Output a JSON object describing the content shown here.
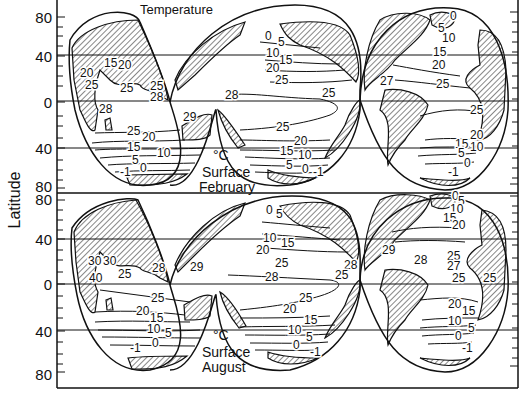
{
  "figure": {
    "title": "Temperature",
    "y_axis_label": "Latitude",
    "panels": [
      {
        "id": "february",
        "unit": "°C",
        "line1": "Surface",
        "line2": "February",
        "lat_ticks": [
          "80",
          "40",
          "0",
          "40",
          "80"
        ]
      },
      {
        "id": "august",
        "unit": "°C",
        "line1": "Surface",
        "line2": "August",
        "lat_ticks": [
          "80",
          "40",
          "0",
          "40",
          "80"
        ]
      }
    ]
  },
  "chart_data": [
    {
      "type": "contour-map",
      "title": "Temperature",
      "subtitle": "°C Surface February",
      "ylabel": "Latitude",
      "yticks": [
        "80N",
        "40N",
        "0",
        "40S",
        "80S"
      ],
      "isotherm_labels": {
        "indian_ocean": [
          "15",
          "20",
          "20",
          "25",
          "25",
          "25",
          "28",
          "28",
          "29",
          "25",
          "20",
          "15",
          "10",
          "5",
          "0",
          "-1"
        ],
        "pacific_ocean": [
          "0",
          "5",
          "10",
          "15",
          "20",
          "25",
          "28",
          "25",
          "25",
          "20",
          "15",
          "10",
          "5",
          "0",
          "-1"
        ],
        "atlantic_ocean": [
          "0",
          "5",
          "10",
          "15",
          "20",
          "27",
          "25",
          "25",
          "20",
          "15",
          "10",
          "5",
          "0",
          "-1"
        ]
      }
    },
    {
      "type": "contour-map",
      "title": "",
      "subtitle": "°C Surface August",
      "ylabel": "Latitude",
      "yticks": [
        "80N",
        "40N",
        "0",
        "40S",
        "80S"
      ],
      "isotherm_labels": {
        "indian_ocean": [
          "30",
          "30",
          "40",
          "25",
          "28",
          "25",
          "20",
          "15",
          "10",
          "5",
          "0",
          "-1"
        ],
        "pacific_ocean": [
          "0",
          "5",
          "10",
          "15",
          "20",
          "25",
          "29",
          "28",
          "28",
          "25",
          "25",
          "20",
          "15",
          "10",
          "5",
          "0",
          "-1"
        ],
        "atlantic_ocean": [
          "0",
          "5",
          "10",
          "15",
          "20",
          "29",
          "28",
          "25",
          "27",
          "25",
          "25",
          "20",
          "15",
          "10",
          "5",
          "0",
          "-1"
        ]
      }
    }
  ],
  "labels": {
    "feb": {
      "io": [
        {
          "t": "15",
          "x": 104,
          "y": 67
        },
        {
          "t": "20",
          "x": 118,
          "y": 69
        },
        {
          "t": "20",
          "x": 80,
          "y": 77
        },
        {
          "t": "25",
          "x": 85,
          "y": 89
        },
        {
          "t": "25",
          "x": 120,
          "y": 92
        },
        {
          "t": "25",
          "x": 150,
          "y": 90
        },
        {
          "t": "28",
          "x": 150,
          "y": 101
        },
        {
          "t": "28",
          "x": 99,
          "y": 113
        },
        {
          "t": "29",
          "x": 183,
          "y": 121
        },
        {
          "t": "25",
          "x": 127,
          "y": 135
        },
        {
          "t": "20",
          "x": 142,
          "y": 141
        },
        {
          "t": "15",
          "x": 127,
          "y": 151
        },
        {
          "t": "10",
          "x": 157,
          "y": 157
        },
        {
          "t": "5",
          "x": 132,
          "y": 164
        },
        {
          "t": "0",
          "x": 140,
          "y": 172
        },
        {
          "t": "-1",
          "x": 120,
          "y": 176
        }
      ],
      "po": [
        {
          "t": "28",
          "x": 225,
          "y": 99
        },
        {
          "t": "0",
          "x": 265,
          "y": 40
        },
        {
          "t": "5",
          "x": 278,
          "y": 46
        },
        {
          "t": "10",
          "x": 266,
          "y": 57
        },
        {
          "t": "15",
          "x": 279,
          "y": 64
        },
        {
          "t": "20",
          "x": 266,
          "y": 72
        },
        {
          "t": "25",
          "x": 275,
          "y": 84
        },
        {
          "t": "25",
          "x": 322,
          "y": 97
        },
        {
          "t": "25",
          "x": 275,
          "y": 131
        },
        {
          "t": "20",
          "x": 294,
          "y": 145
        },
        {
          "t": "25",
          "x": 276,
          "y": 131
        },
        {
          "t": "15",
          "x": 280,
          "y": 155
        },
        {
          "t": "10",
          "x": 298,
          "y": 159
        },
        {
          "t": "5",
          "x": 286,
          "y": 169
        },
        {
          "t": "0",
          "x": 302,
          "y": 173
        },
        {
          "t": "-1",
          "x": 313,
          "y": 176
        }
      ],
      "ao": [
        {
          "t": "0",
          "x": 450,
          "y": 20
        },
        {
          "t": "5",
          "x": 438,
          "y": 32
        },
        {
          "t": "10",
          "x": 442,
          "y": 42
        },
        {
          "t": "15",
          "x": 433,
          "y": 56
        },
        {
          "t": "20",
          "x": 432,
          "y": 69
        },
        {
          "t": "27",
          "x": 380,
          "y": 85
        },
        {
          "t": "25",
          "x": 436,
          "y": 88
        },
        {
          "t": "25",
          "x": 470,
          "y": 114
        },
        {
          "t": "20",
          "x": 470,
          "y": 139
        },
        {
          "t": "15",
          "x": 455,
          "y": 148
        },
        {
          "t": "10",
          "x": 470,
          "y": 151
        },
        {
          "t": "5",
          "x": 458,
          "y": 157
        },
        {
          "t": "0",
          "x": 464,
          "y": 167
        },
        {
          "t": "-1",
          "x": 448,
          "y": 176
        }
      ]
    },
    "aug": {
      "io": [
        {
          "t": "30",
          "x": 88,
          "y": 265
        },
        {
          "t": "30",
          "x": 103,
          "y": 265
        },
        {
          "t": "40",
          "x": 89,
          "y": 282
        },
        {
          "t": "25",
          "x": 118,
          "y": 278
        },
        {
          "t": "28",
          "x": 152,
          "y": 272
        },
        {
          "t": "25",
          "x": 151,
          "y": 302
        },
        {
          "t": "20",
          "x": 136,
          "y": 315
        },
        {
          "t": "15",
          "x": 150,
          "y": 322
        },
        {
          "t": "10",
          "x": 147,
          "y": 333
        },
        {
          "t": "5",
          "x": 165,
          "y": 337
        },
        {
          "t": "0",
          "x": 152,
          "y": 347
        },
        {
          "t": "-1",
          "x": 130,
          "y": 352
        }
      ],
      "po": [
        {
          "t": "0",
          "x": 266,
          "y": 214
        },
        {
          "t": "5",
          "x": 276,
          "y": 218
        },
        {
          "t": "10",
          "x": 263,
          "y": 242
        },
        {
          "t": "15",
          "x": 281,
          "y": 247
        },
        {
          "t": "20",
          "x": 256,
          "y": 254
        },
        {
          "t": "25",
          "x": 275,
          "y": 267
        },
        {
          "t": "29",
          "x": 190,
          "y": 271
        },
        {
          "t": "28",
          "x": 265,
          "y": 281
        },
        {
          "t": "28",
          "x": 344,
          "y": 269
        },
        {
          "t": "25",
          "x": 335,
          "y": 279
        },
        {
          "t": "25",
          "x": 299,
          "y": 302
        },
        {
          "t": "20",
          "x": 283,
          "y": 313
        },
        {
          "t": "15",
          "x": 304,
          "y": 324
        },
        {
          "t": "10",
          "x": 288,
          "y": 334
        },
        {
          "t": "5",
          "x": 306,
          "y": 341
        },
        {
          "t": "0",
          "x": 293,
          "y": 349
        },
        {
          "t": "-1",
          "x": 310,
          "y": 356
        }
      ],
      "ao": [
        {
          "t": "0",
          "x": 452,
          "y": 200
        },
        {
          "t": "5",
          "x": 458,
          "y": 205
        },
        {
          "t": "10",
          "x": 450,
          "y": 213
        },
        {
          "t": "15",
          "x": 443,
          "y": 222
        },
        {
          "t": "20",
          "x": 452,
          "y": 229
        },
        {
          "t": "29",
          "x": 382,
          "y": 254
        },
        {
          "t": "28",
          "x": 414,
          "y": 264
        },
        {
          "t": "25",
          "x": 447,
          "y": 260
        },
        {
          "t": "27",
          "x": 447,
          "y": 270
        },
        {
          "t": "25",
          "x": 452,
          "y": 282
        },
        {
          "t": "25",
          "x": 483,
          "y": 282
        },
        {
          "t": "20",
          "x": 448,
          "y": 308
        },
        {
          "t": "15",
          "x": 462,
          "y": 315
        },
        {
          "t": "10",
          "x": 448,
          "y": 325
        },
        {
          "t": "5",
          "x": 468,
          "y": 332
        },
        {
          "t": "0",
          "x": 455,
          "y": 340
        },
        {
          "t": "-1",
          "x": 462,
          "y": 352
        }
      ]
    }
  }
}
